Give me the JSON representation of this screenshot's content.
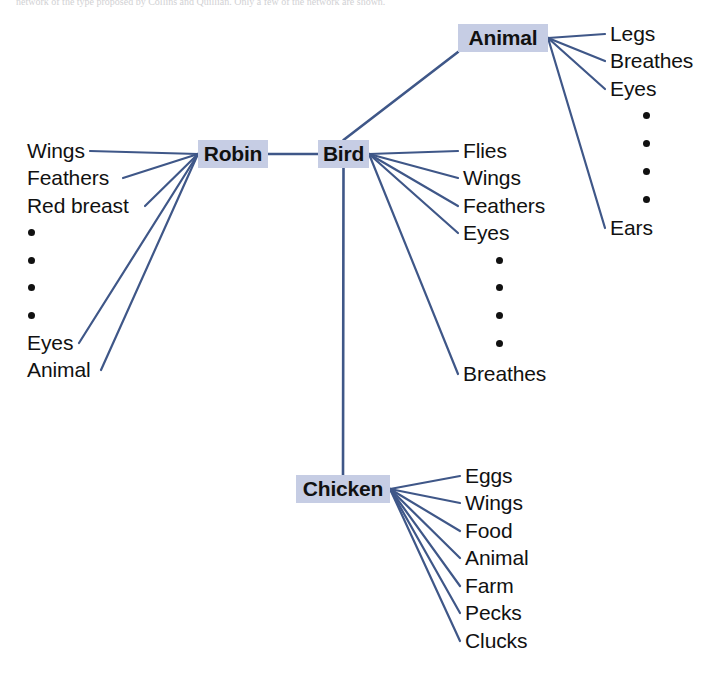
{
  "figure": {
    "caption_fragment": "network of the type proposed by Collins and Quillian. Only a few of the network are shown.",
    "line_color": "#3f5788",
    "node_fill": "#c6cde4",
    "text_color": "#111111",
    "background": "#ffffff",
    "width": 721,
    "height": 673
  },
  "nodes": [
    {
      "id": "animal",
      "label": "Animal",
      "x": 458,
      "y": 24,
      "w": 90,
      "h": 28
    },
    {
      "id": "robin",
      "label": "Robin",
      "x": 198,
      "y": 140,
      "w": 70,
      "h": 28
    },
    {
      "id": "bird",
      "label": "Bird",
      "x": 318,
      "y": 140,
      "w": 51,
      "h": 28
    },
    {
      "id": "chicken",
      "label": "Chicken",
      "x": 296,
      "y": 475,
      "w": 94,
      "h": 28
    }
  ],
  "node_links": [
    {
      "from": "robin",
      "to": "bird"
    },
    {
      "from": "bird",
      "to": "animal"
    },
    {
      "from": "bird",
      "to": "chicken"
    }
  ],
  "properties": {
    "animal": {
      "anchor": {
        "x": 548,
        "y": 38
      },
      "label_x": 610,
      "items": [
        {
          "type": "text",
          "text": "Legs",
          "y": 38
        },
        {
          "type": "text",
          "text": "Breathes",
          "y": 65
        },
        {
          "type": "text",
          "text": "Eyes",
          "y": 93
        },
        {
          "type": "dot",
          "text": "",
          "y": 120
        },
        {
          "type": "dot",
          "text": "",
          "y": 148
        },
        {
          "type": "dot",
          "text": "",
          "y": 176
        },
        {
          "type": "dot",
          "text": "",
          "y": 204
        },
        {
          "type": "text",
          "text": "Ears",
          "y": 232
        }
      ]
    },
    "bird": {
      "anchor": {
        "x": 369,
        "y": 154
      },
      "label_x": 463,
      "items": [
        {
          "type": "text",
          "text": "Flies",
          "y": 155
        },
        {
          "type": "text",
          "text": "Wings",
          "y": 182
        },
        {
          "type": "text",
          "text": "Feathers",
          "y": 210
        },
        {
          "type": "text",
          "text": "Eyes",
          "y": 237
        },
        {
          "type": "dot",
          "text": "",
          "y": 265
        },
        {
          "type": "dot",
          "text": "",
          "y": 292
        },
        {
          "type": "dot",
          "text": "",
          "y": 320
        },
        {
          "type": "dot",
          "text": "",
          "y": 348
        },
        {
          "type": "text",
          "text": "Breathes",
          "y": 378
        }
      ]
    },
    "robin": {
      "anchor": {
        "x": 198,
        "y": 154
      },
      "label_x": 27,
      "items": [
        {
          "type": "text",
          "text": "Wings",
          "y": 155
        },
        {
          "type": "text",
          "text": "Feathers",
          "y": 182
        },
        {
          "type": "text",
          "text": "Red breast",
          "y": 210
        },
        {
          "type": "dot",
          "text": "",
          "y": 237
        },
        {
          "type": "dot",
          "text": "",
          "y": 265
        },
        {
          "type": "dot",
          "text": "",
          "y": 292
        },
        {
          "type": "dot",
          "text": "",
          "y": 320
        },
        {
          "type": "text",
          "text": "Eyes",
          "y": 347
        },
        {
          "type": "text",
          "text": "Animal",
          "y": 374
        }
      ]
    },
    "chicken": {
      "anchor": {
        "x": 390,
        "y": 489
      },
      "label_x": 465,
      "items": [
        {
          "type": "text",
          "text": "Eggs",
          "y": 480
        },
        {
          "type": "text",
          "text": "Wings",
          "y": 507
        },
        {
          "type": "text",
          "text": "Food",
          "y": 535
        },
        {
          "type": "text",
          "text": "Animal",
          "y": 562
        },
        {
          "type": "text",
          "text": "Farm",
          "y": 590
        },
        {
          "type": "text",
          "text": "Pecks",
          "y": 617
        },
        {
          "type": "text",
          "text": "Clucks",
          "y": 645
        }
      ]
    }
  }
}
